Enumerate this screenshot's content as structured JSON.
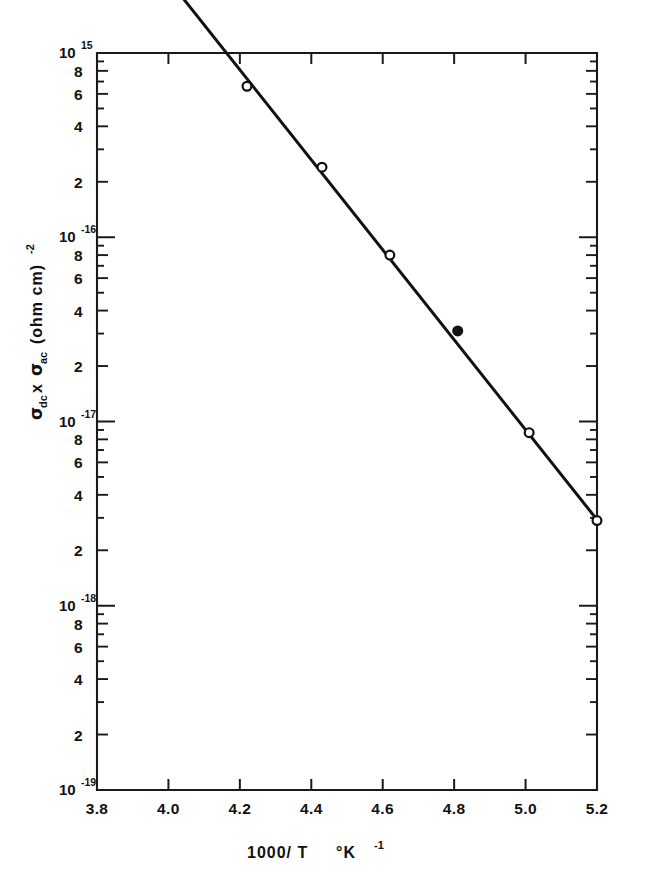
{
  "figure": {
    "background_color": "#ffffff",
    "ink_color": "#111111"
  },
  "axes": {
    "x": {
      "label_main": "1000/ T",
      "label_unit_deg": "°K",
      "label_unit_exp": "-1",
      "tick_labels": [
        "3.8",
        "4.0",
        "4.2",
        "4.4",
        "4.6",
        "4.8",
        "5.0",
        "5.2"
      ],
      "tick_values": [
        3.8,
        4.0,
        4.2,
        4.4,
        4.6,
        4.8,
        5.0,
        5.2
      ],
      "min": 3.8,
      "max": 5.2
    },
    "y": {
      "label_sigma1": "σ",
      "label_sigma1_sub": "dc",
      "label_times": "x",
      "label_sigma2": "σ",
      "label_sigma2_sub": "ac",
      "label_units": "(ohm cm)",
      "label_units_exp": "-2",
      "decade_labels": [
        "10",
        "10",
        "10",
        "10",
        "10"
      ],
      "decade_exponents": [
        "15",
        "-16",
        "-17",
        "-18",
        "-19"
      ],
      "decade_values": [
        1e-15,
        1e-16,
        1e-17,
        1e-18,
        1e-19
      ],
      "minor_labels": [
        "8",
        "6",
        "4",
        "2"
      ],
      "minor_label_values": [
        8,
        6,
        4,
        2
      ],
      "min": 1e-19,
      "max": 1e-15,
      "scale": "log"
    }
  },
  "chart_data": {
    "type": "scatter",
    "title": "",
    "xlabel": "1000/T  °K⁻¹",
    "ylabel": "σdc x σac (ohm cm)⁻²",
    "xlim": [
      3.8,
      5.2
    ],
    "ylim": [
      1e-19,
      1e-15
    ],
    "yscale": "log",
    "grid": false,
    "legend": false,
    "x": [
      3.8,
      4.03,
      4.22,
      4.43,
      4.62,
      4.81,
      5.01,
      5.2
    ],
    "y": [
      7.5e-15,
      2.3e-15,
      6.6e-16,
      2.4e-16,
      8e-17,
      3.1e-17,
      8.7e-18,
      2.9e-18
    ],
    "marker_styles": [
      "open",
      "open",
      "open",
      "open",
      "open",
      "filled",
      "open",
      "open"
    ],
    "fit_line": {
      "x_start": 3.795,
      "y_start": 7.9e-15,
      "x_end": 5.205,
      "y_end": 2.85e-18,
      "style": "solid"
    }
  }
}
